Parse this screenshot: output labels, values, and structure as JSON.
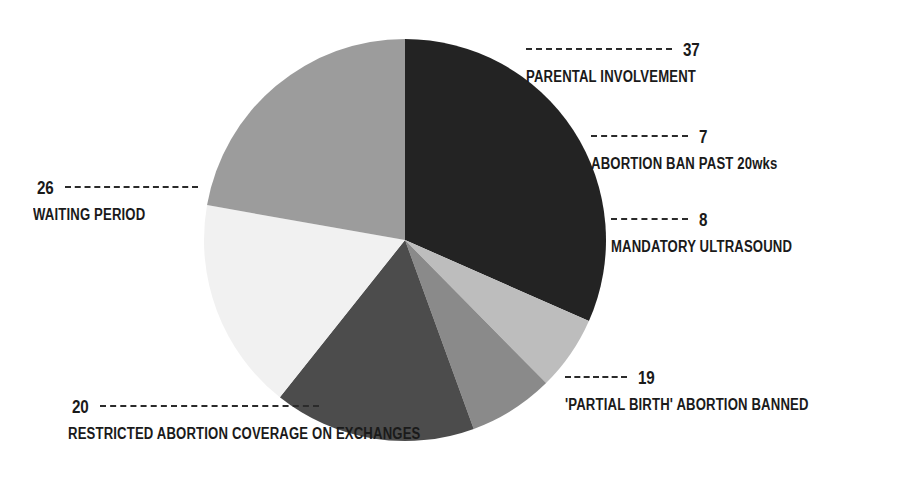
{
  "chart_data": {
    "type": "pie",
    "title": "",
    "subtitle": "",
    "xlabel": "",
    "ylabel": "",
    "legend_position": "callout-labels",
    "grid": false,
    "total": 117,
    "categories": [
      "PARENTAL INVOLVEMENT",
      "ABORTION BAN PAST 20wks",
      "MANDATORY ULTRASOUND",
      "'PARTIAL BIRTH' ABORTION BANNED",
      "RESTRICTED ABORTION COVERAGE ON EXCHANGES",
      "WAITING PERIOD"
    ],
    "values": [
      37,
      7,
      8,
      19,
      20,
      26
    ],
    "colors": [
      "#232323",
      "#bdbdbd",
      "#8a8a8a",
      "#4c4c4c",
      "#f1f1f1",
      "#9c9c9c"
    ],
    "slices": [
      {
        "id": "parental-involvement",
        "label": "PARENTAL INVOLVEMENT",
        "value": 37,
        "value_text": "37",
        "color": "#232323",
        "start_angle": 0,
        "end_angle": 113.8
      },
      {
        "id": "abortion-ban-past-20wks",
        "label": "ABORTION BAN PAST 20wks",
        "value": 7,
        "value_text": "7",
        "color": "#bdbdbd",
        "start_angle": 113.8,
        "end_angle": 135.4
      },
      {
        "id": "mandatory-ultrasound",
        "label": "MANDATORY ULTRASOUND",
        "value": 8,
        "value_text": "8",
        "color": "#8a8a8a",
        "start_angle": 135.4,
        "end_angle": 160.0
      },
      {
        "id": "partial-birth-abortion-banned",
        "label": "'PARTIAL BIRTH' ABORTION BANNED",
        "value": 19,
        "value_text": "19",
        "color": "#4c4c4c",
        "start_angle": 160.0,
        "end_angle": 218.5
      },
      {
        "id": "restricted-abortion-coverage-on-exchanges",
        "label": "RESTRICTED ABORTION COVERAGE ON EXCHANGES",
        "value": 20,
        "value_text": "20",
        "color": "#f1f1f1",
        "start_angle": 218.5,
        "end_angle": 280.0
      },
      {
        "id": "waiting-period",
        "label": "WAITING PERIOD",
        "value": 26,
        "value_text": "26",
        "color": "#9c9c9c",
        "start_angle": 280.0,
        "end_angle": 360.0
      }
    ]
  },
  "callouts": {
    "parental": {
      "value": "37",
      "label": "PARENTAL INVOLVEMENT"
    },
    "ban20": {
      "value": "7",
      "label": "ABORTION BAN PAST 20wks"
    },
    "ultrasound": {
      "value": "8",
      "label": "MANDATORY ULTRASOUND"
    },
    "partial": {
      "value": "19",
      "label": "'PARTIAL BIRTH' ABORTION BANNED"
    },
    "restricted": {
      "value": "20",
      "label": "RESTRICTED ABORTION COVERAGE ON EXCHANGES"
    },
    "waiting": {
      "value": "26",
      "label": "WAITING PERIOD"
    }
  },
  "style": {
    "background": "#ffffff",
    "text_color": "#1a1a1a",
    "leader_color": "#2b2b2b"
  }
}
